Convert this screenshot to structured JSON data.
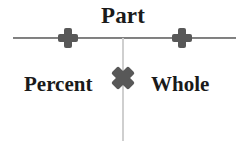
{
  "diagram": {
    "type": "percent-proportion-triangle",
    "background_color": "#ffffff",
    "labels": {
      "top": "Part",
      "left": "Percent",
      "right": "Whole"
    },
    "markers": [
      {
        "name": "plus-marker-left",
        "glyph": "plus",
        "color": "#585858",
        "x": 68,
        "y": 38
      },
      {
        "name": "plus-marker-right",
        "glyph": "plus",
        "color": "#585858",
        "x": 182,
        "y": 38
      },
      {
        "name": "cross-marker-center",
        "glyph": "cross",
        "color": "#585858",
        "x": 123,
        "y": 78
      }
    ],
    "lines": [
      {
        "name": "horizontal-divider",
        "color": "#7a7a7a",
        "orientation": "horizontal",
        "x1": 13,
        "y1": 38,
        "x2": 236,
        "y2": 38
      },
      {
        "name": "vertical-divider",
        "color": "#cfcfcf",
        "orientation": "vertical",
        "x1": 123,
        "y1": 38,
        "x2": 123,
        "y2": 141
      }
    ]
  }
}
